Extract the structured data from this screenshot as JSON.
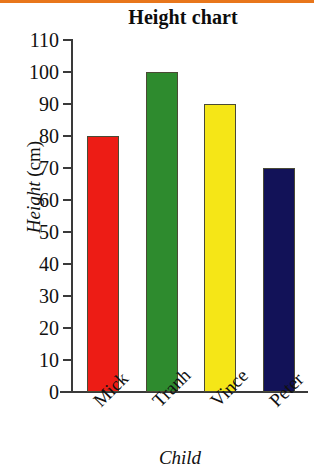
{
  "figure": {
    "top_rule_color": "#E8761B",
    "background": "#ffffff"
  },
  "chart_data": {
    "type": "bar",
    "title": "Height chart",
    "xlabel": "Child",
    "ylabel": "Height (cm)",
    "ylabel_italic_part": "Height",
    "ylabel_upright_part": " (cm)",
    "categories": [
      "Mick",
      "Tranh",
      "Vince",
      "Peter"
    ],
    "values": [
      80,
      100,
      90,
      70
    ],
    "bar_colors": [
      "#ED1C15",
      "#2E8B2E",
      "#F5E617",
      "#121258"
    ],
    "bar_border_color": "#4a4a35",
    "ylim": [
      0,
      110
    ],
    "ytick_step": 10,
    "yticks": [
      0,
      10,
      20,
      30,
      40,
      50,
      60,
      70,
      80,
      90,
      100,
      110
    ],
    "ytick_labels": [
      "0",
      "10",
      "20",
      "30",
      "40",
      "50",
      "60",
      "70",
      "80",
      "90",
      "100",
      "110"
    ],
    "grid": false,
    "legend": null,
    "tick_direction": "out",
    "xtick_label_rotation_deg": -45,
    "axis_color": "#3a3a3a"
  }
}
